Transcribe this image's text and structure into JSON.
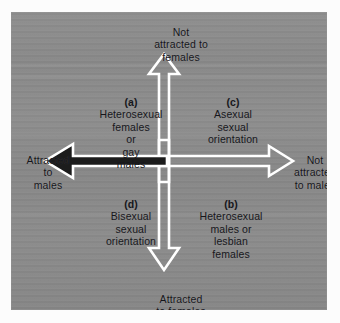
{
  "figure": {
    "type": "two-dimensional-sexual-orientation-grid",
    "background_color": "#8a8a8a",
    "frame_color": "#fcfcfc",
    "arrow_outline_color": "#ffffff",
    "arrow_fill_color": "#8a8a8a",
    "left_arrow_fill_color": "#1c1c1c",
    "text_color": "#17171c"
  },
  "axes": {
    "top": {
      "label_lines": [
        "Not",
        "attracted to",
        "females"
      ],
      "direction": "up",
      "style": "outlined"
    },
    "bottom": {
      "label_lines": [
        "Attracted",
        "to females"
      ],
      "direction": "down",
      "style": "outlined"
    },
    "left": {
      "label_lines": [
        "Attracted",
        "to",
        "males"
      ],
      "direction": "left",
      "style": "filled-dark"
    },
    "right": {
      "label_lines": [
        "Not",
        "attracted",
        "to males"
      ],
      "direction": "right",
      "style": "outlined"
    }
  },
  "quadrants": [
    {
      "key": "(a)",
      "position": "upper-left",
      "lines": [
        "Heterosexual",
        "females",
        "or",
        "gay",
        "males"
      ]
    },
    {
      "key": "(c)",
      "position": "upper-right",
      "lines": [
        "Asexual",
        "sexual",
        "orientation"
      ]
    },
    {
      "key": "(d)",
      "position": "lower-left",
      "lines": [
        "Bisexual",
        "sexual",
        "orientation"
      ]
    },
    {
      "key": "(b)",
      "position": "lower-right",
      "lines": [
        "Heterosexual",
        "males or",
        "lesbian",
        "females"
      ]
    }
  ]
}
